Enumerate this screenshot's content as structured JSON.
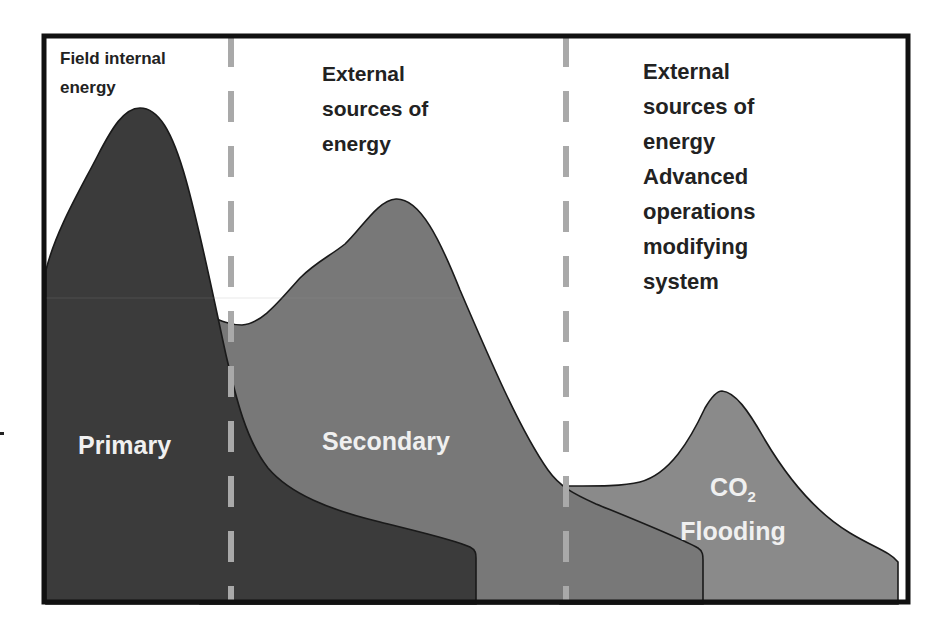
{
  "diagram": {
    "colors": {
      "frame": "#111111",
      "background": "#ffffff",
      "primary_fill": "#3b3b3b",
      "secondary_fill": "#777777",
      "co2_fill": "#8a8a8a",
      "divider": "#a9a9a9",
      "header_text": "#222222",
      "area_text": "#f0f0f0"
    },
    "regions": [
      {
        "id": "field-internal",
        "header_lines": [
          "Field internal",
          "energy"
        ],
        "header": "Field internal\nenergy"
      },
      {
        "id": "external",
        "header_lines": [
          "External",
          "sources of",
          "energy"
        ],
        "header": "External\nsources of\nenergy"
      },
      {
        "id": "external-advanced",
        "header_lines": [
          "External",
          "sources of",
          "energy",
          "Advanced",
          "operations",
          "modifying",
          "system"
        ],
        "header": "External\nsources of\nenergy\nAdvanced\noperations\nmodifying\nsystem"
      }
    ],
    "areas": [
      {
        "id": "primary",
        "label": "Primary"
      },
      {
        "id": "secondary",
        "label": "Secondary"
      },
      {
        "id": "co2",
        "label_main": "CO",
        "label_sub": "2",
        "label_line2": "Flooding"
      }
    ],
    "dividers": [
      {
        "between": [
          "field-internal",
          "external"
        ],
        "style": "dashed"
      },
      {
        "between": [
          "external",
          "external-advanced"
        ],
        "style": "dashed"
      }
    ]
  }
}
